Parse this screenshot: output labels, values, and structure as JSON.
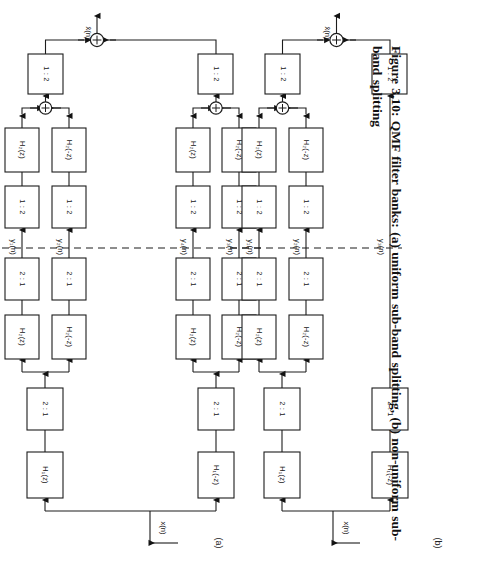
{
  "page": {
    "running_head": "CHAPTER 3.  SPEECH CODING",
    "folio": "84",
    "caption": "Figure 3.10: QMF filter banks: (a) uniform sub-band splitting, (b) non-uniform sub-band splitting",
    "width": 495,
    "height": 583,
    "rotation_deg": 90,
    "ink_color": "#1c1c1c",
    "paper_color": "#ffffff"
  },
  "figure": {
    "number": "Figure 3.10",
    "title": "QMF filter banks",
    "panels": [
      {
        "key": "a",
        "label": "(a)",
        "description": "uniform sub-band splitting",
        "input_label": "x(n)",
        "output_label": "x̂(n)",
        "analysis_stage1": [
          "H₁(z)",
          "H₁(-z)"
        ],
        "analysis_decimators": [
          "2 : 1",
          "2 : 1"
        ],
        "analysis_stage2": [
          "H₂(z)",
          "H₂(-z)",
          "H₂(z)",
          "H₂(-z)"
        ],
        "analysis_decimators2": [
          "2 : 1",
          "2 : 1",
          "2 : 1",
          "2 : 1"
        ],
        "subband_signals": [
          "y₁(n)",
          "y₂(n)",
          "y₄(n)",
          "y₃(n)"
        ],
        "synthesis_interpolators2": [
          "1 : 2",
          "1 : 2",
          "1 : 2",
          "1 : 2"
        ],
        "synthesis_stage2": [
          "H₂(z)",
          "H₂(-z)",
          "H₂(z)",
          "H₂(-z)"
        ],
        "synthesis_interpolators1": [
          "1 : 2",
          "1 : 2"
        ],
        "synthesis_stage1": [
          "H₁(z)",
          "H₁(-z)"
        ],
        "adders": 3,
        "adder_symbol": "+"
      },
      {
        "key": "b",
        "label": "(b)",
        "description": "non-uniform sub-band splitting",
        "input_label": "x(n)",
        "output_label": "x̂(n)",
        "analysis_stage1": [
          "H₁(z)",
          "H₁(-z)"
        ],
        "analysis_decimators": [
          "2 : 1",
          "2 : 1"
        ],
        "analysis_stage2": [
          "H₂(z)",
          "H₂(-z)"
        ],
        "analysis_decimators2": [
          "2 : 1",
          "2 : 1"
        ],
        "subband_signals": [
          "y₁(n)",
          "y₂(n)",
          "y₃(n)"
        ],
        "synthesis_interpolators2": [
          "1 : 2",
          "1 : 2"
        ],
        "synthesis_stage2": [
          "H₂(z)",
          "H₂(-z)"
        ],
        "synthesis_interpolators1": [
          "1 : 2",
          "1 : 2"
        ],
        "synthesis_stage1": [
          "H₁(z)",
          "H₁(-z)"
        ],
        "adders": 2,
        "adder_symbol": "+"
      }
    ],
    "dashed_divider": "analysis / synthesis boundary (dashed line)",
    "box_labels_all": [
      "H₁(z)",
      "H₁(-z)",
      "H₂(z)",
      "H₂(-z)",
      "2 : 1",
      "1 : 2"
    ]
  }
}
